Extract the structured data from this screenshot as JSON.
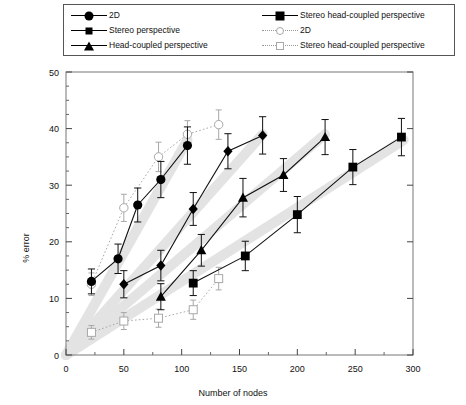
{
  "legend": {
    "column_left": [
      {
        "label": "2D",
        "marker": "circle-filled",
        "line": "solid"
      },
      {
        "label": "Stereo perspective",
        "marker": "diamond-filled",
        "line": "solid"
      },
      {
        "label": "Head-coupled perspective",
        "marker": "triangle-filled",
        "line": "solid"
      }
    ],
    "column_right": [
      {
        "label": "Stereo head-coupled perspective",
        "marker": "square-filled",
        "line": "solid"
      },
      {
        "label": "2D",
        "marker": "circle-open",
        "line": "dotted"
      },
      {
        "label": "Stereo head-coupled perspective",
        "marker": "square-open",
        "line": "dotted"
      }
    ]
  },
  "chart_data": {
    "type": "line",
    "title": "",
    "xlabel": "Number of nodes",
    "ylabel": "% error",
    "xlim": [
      0,
      300
    ],
    "ylim": [
      0,
      50
    ],
    "xticks": [
      0,
      50,
      100,
      150,
      200,
      250,
      300
    ],
    "yticks": [
      0,
      10,
      20,
      30,
      40,
      50
    ],
    "xtick_labels": [
      "0",
      "50",
      "100",
      "150",
      "200",
      "250",
      "300"
    ],
    "ytick_labels": [
      "0",
      "10",
      "20",
      "30",
      "40",
      "50"
    ],
    "minor_ticks": true,
    "grid": false,
    "legend_position": "above-plot",
    "error_bars": true,
    "series": [
      {
        "name": "2D",
        "marker": "circle-filled",
        "line": "solid",
        "color": "#000000",
        "x": [
          22,
          45,
          62,
          82,
          105
        ],
        "y": [
          13.0,
          17.0,
          26.5,
          31.0,
          37.0
        ],
        "yerr": [
          2.2,
          2.6,
          3.0,
          3.2,
          3.3
        ]
      },
      {
        "name": "Stereo perspective",
        "marker": "diamond-filled",
        "line": "solid",
        "color": "#000000",
        "x": [
          50,
          82,
          110,
          140,
          170
        ],
        "y": [
          12.5,
          15.8,
          25.8,
          36.0,
          38.8
        ],
        "yerr": [
          2.4,
          2.7,
          2.9,
          3.1,
          3.3
        ]
      },
      {
        "name": "Head-coupled perspective",
        "marker": "triangle-filled",
        "line": "solid",
        "color": "#000000",
        "x": [
          82,
          117,
          153,
          188,
          224
        ],
        "y": [
          10.3,
          18.5,
          27.8,
          31.8,
          38.5
        ],
        "yerr": [
          2.3,
          2.8,
          3.4,
          2.9,
          3.1
        ]
      },
      {
        "name": "Stereo head-coupled perspective",
        "marker": "square-filled",
        "line": "solid",
        "color": "#000000",
        "x": [
          110,
          155,
          200,
          248,
          290
        ],
        "y": [
          12.7,
          17.5,
          24.8,
          33.2,
          38.5
        ],
        "yerr": [
          2.2,
          2.6,
          3.2,
          3.1,
          3.3
        ]
      },
      {
        "name": "2D",
        "marker": "circle-open",
        "line": "dotted",
        "color": "#a8a8a8",
        "x": [
          22,
          50,
          80,
          105,
          132
        ],
        "y": [
          12.5,
          26.0,
          35.0,
          39.0,
          40.7
        ],
        "yerr": [
          2.0,
          2.4,
          2.6,
          2.4,
          2.6
        ]
      },
      {
        "name": "Stereo head-coupled perspective",
        "marker": "square-open",
        "line": "dotted",
        "color": "#a8a8a8",
        "x": [
          22,
          50,
          80,
          110,
          132
        ],
        "y": [
          4.0,
          6.0,
          6.5,
          8.0,
          13.5
        ],
        "yerr": [
          1.2,
          1.5,
          1.6,
          1.7,
          2.0
        ]
      }
    ],
    "trend_bands": [
      {
        "from": [
          0,
          0
        ],
        "to": [
          105,
          38
        ],
        "width": 10
      },
      {
        "from": [
          0,
          0
        ],
        "to": [
          170,
          39
        ],
        "width": 10
      },
      {
        "from": [
          0,
          0
        ],
        "to": [
          224,
          39
        ],
        "width": 10
      },
      {
        "from": [
          0,
          0
        ],
        "to": [
          292,
          38
        ],
        "width": 10
      }
    ]
  }
}
